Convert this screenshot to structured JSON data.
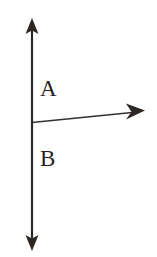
{
  "figure": {
    "background_color": "#ffffff",
    "ink_color": "#2b2725",
    "width": 157,
    "height": 257,
    "labels": [
      {
        "id": "a",
        "text": "A",
        "name": "label-a",
        "x": 40,
        "y": 77,
        "font_size": 23,
        "position_note": "upper region, right of vertical line, above horizontal arrow"
      },
      {
        "id": "b",
        "text": "B",
        "name": "label-b",
        "x": 40,
        "y": 147,
        "font_size": 23,
        "position_note": "lower region, right of vertical line, below horizontal arrow"
      }
    ],
    "strokes": [
      {
        "id": "vertical-line",
        "name": "vertical-double-arrow",
        "type": "double-headed-arrow",
        "orientation": "vertical",
        "x1": 32,
        "y1": 19,
        "x2": 32,
        "y2": 250,
        "stroke_width": 2.2,
        "color": "#2b2725"
      },
      {
        "id": "horizontal-line",
        "name": "horizontal-arrow",
        "type": "single-headed-arrow",
        "orientation": "horizontal-slight-upward",
        "x1": 32,
        "y1": 122,
        "x2": 143,
        "y2": 111,
        "stroke_width": 1.6,
        "color": "#35302d"
      }
    ],
    "arrowheads": [
      {
        "id": "arrowhead-top",
        "name": "arrowhead-up",
        "direction": "up",
        "tip_x": 32,
        "tip_y": 19,
        "half_width": 7,
        "length": 15,
        "color": "#2b2725"
      },
      {
        "id": "arrowhead-bottom",
        "name": "arrowhead-down",
        "direction": "down",
        "tip_x": 32,
        "tip_y": 250,
        "half_width": 7,
        "length": 15,
        "color": "#2b2725"
      },
      {
        "id": "arrowhead-right",
        "name": "arrowhead-right",
        "direction": "right",
        "tip_x": 144,
        "tip_y": 111,
        "half_width": 8,
        "length": 18,
        "color": "#2b2725"
      }
    ],
    "intersection": {
      "name": "intersection-point",
      "x": 32,
      "y": 122
    }
  }
}
